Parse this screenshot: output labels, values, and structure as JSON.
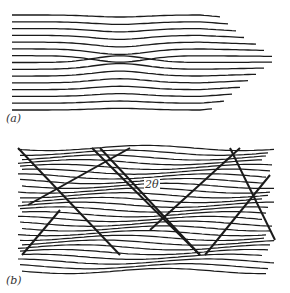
{
  "figure": {
    "panels": [
      {
        "id": "a",
        "label": "(a)",
        "description": "Parallel lattice lines with a single edge dislocation; lines converge to a point on the right",
        "line_count": 15
      },
      {
        "id": "b",
        "label": "(b)",
        "description": "Lattice lines with a network of crossing dislocation walls forming rhombic domains",
        "line_count": 27,
        "annotation": "2θ"
      }
    ],
    "ink_color": "#1a1a1a",
    "background_color": "#ffffff"
  }
}
